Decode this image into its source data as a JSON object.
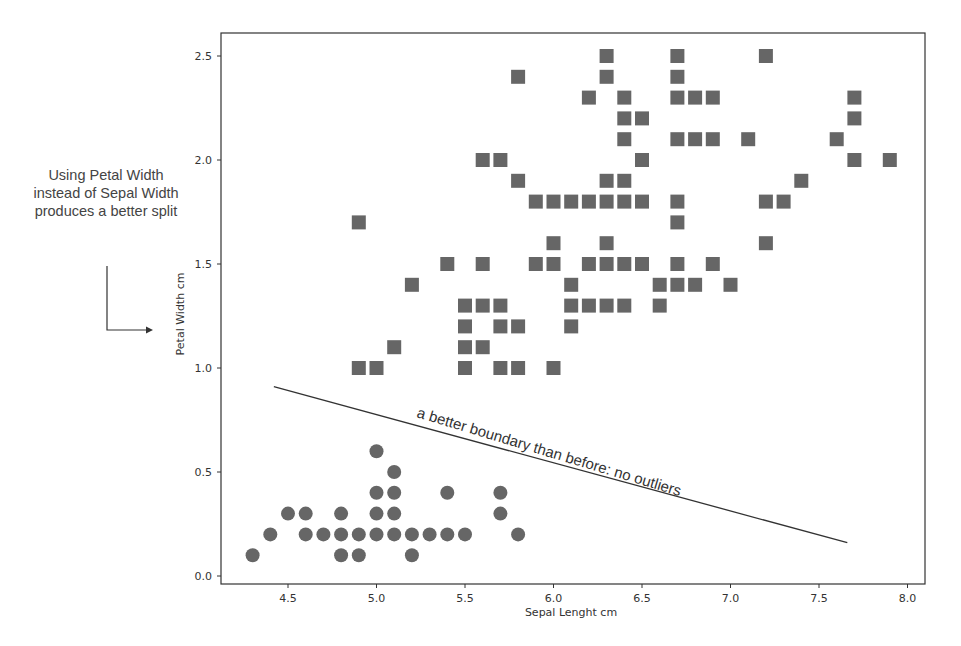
{
  "side_note": "Using Petal Width instead of Sepal Width produces a better split",
  "chart_data": {
    "type": "scatter",
    "title": "",
    "xlabel": "Sepal Lenght cm",
    "ylabel": "Petal Width cm",
    "xlim": [
      4.12,
      8.1
    ],
    "ylim": [
      -0.04,
      2.65
    ],
    "xticks": [
      4.5,
      5.0,
      5.5,
      6.0,
      6.5,
      7.0,
      7.5,
      8.0
    ],
    "xtick_labels": [
      "4.5",
      "5.0",
      "5.5",
      "6.0",
      "6.5",
      "7.0",
      "7.5",
      "8.0"
    ],
    "yticks": [
      0.0,
      0.5,
      1.0,
      1.5,
      2.0,
      2.5
    ],
    "ytick_labels": [
      "0.0",
      "0.5",
      "1.0",
      "1.5",
      "2.0",
      "2.5"
    ],
    "grid": false,
    "legend": null,
    "marker_color": "#666666",
    "series": [
      {
        "name": "circles",
        "marker": "circle",
        "points": [
          [
            4.3,
            0.1
          ],
          [
            4.8,
            0.1
          ],
          [
            4.9,
            0.1
          ],
          [
            5.2,
            0.1
          ],
          [
            4.4,
            0.2
          ],
          [
            4.6,
            0.2
          ],
          [
            4.7,
            0.2
          ],
          [
            4.8,
            0.2
          ],
          [
            4.9,
            0.2
          ],
          [
            5.0,
            0.2
          ],
          [
            5.1,
            0.2
          ],
          [
            5.2,
            0.2
          ],
          [
            5.3,
            0.2
          ],
          [
            5.4,
            0.2
          ],
          [
            5.5,
            0.2
          ],
          [
            5.8,
            0.2
          ],
          [
            4.5,
            0.3
          ],
          [
            4.6,
            0.3
          ],
          [
            4.8,
            0.3
          ],
          [
            5.0,
            0.3
          ],
          [
            5.1,
            0.3
          ],
          [
            5.7,
            0.3
          ],
          [
            5.0,
            0.4
          ],
          [
            5.1,
            0.4
          ],
          [
            5.4,
            0.4
          ],
          [
            5.7,
            0.4
          ],
          [
            5.1,
            0.5
          ],
          [
            5.0,
            0.6
          ]
        ]
      },
      {
        "name": "squares",
        "marker": "square",
        "points": [
          [
            4.9,
            1.0
          ],
          [
            5.0,
            1.0
          ],
          [
            5.5,
            1.0
          ],
          [
            5.7,
            1.0
          ],
          [
            5.8,
            1.0
          ],
          [
            6.0,
            1.0
          ],
          [
            5.1,
            1.1
          ],
          [
            5.5,
            1.1
          ],
          [
            5.6,
            1.1
          ],
          [
            5.5,
            1.2
          ],
          [
            5.7,
            1.2
          ],
          [
            5.8,
            1.2
          ],
          [
            6.1,
            1.2
          ],
          [
            5.5,
            1.3
          ],
          [
            5.6,
            1.3
          ],
          [
            5.7,
            1.3
          ],
          [
            6.1,
            1.3
          ],
          [
            6.2,
            1.3
          ],
          [
            6.3,
            1.3
          ],
          [
            6.4,
            1.3
          ],
          [
            6.6,
            1.3
          ],
          [
            5.2,
            1.4
          ],
          [
            6.1,
            1.4
          ],
          [
            6.6,
            1.4
          ],
          [
            6.7,
            1.4
          ],
          [
            6.8,
            1.4
          ],
          [
            7.0,
            1.4
          ],
          [
            5.4,
            1.5
          ],
          [
            5.6,
            1.5
          ],
          [
            5.9,
            1.5
          ],
          [
            6.0,
            1.5
          ],
          [
            6.2,
            1.5
          ],
          [
            6.3,
            1.5
          ],
          [
            6.4,
            1.5
          ],
          [
            6.5,
            1.5
          ],
          [
            6.7,
            1.5
          ],
          [
            6.9,
            1.5
          ],
          [
            6.0,
            1.6
          ],
          [
            6.3,
            1.6
          ],
          [
            7.2,
            1.6
          ],
          [
            4.9,
            1.7
          ],
          [
            6.7,
            1.7
          ],
          [
            5.9,
            1.8
          ],
          [
            6.0,
            1.8
          ],
          [
            6.1,
            1.8
          ],
          [
            6.2,
            1.8
          ],
          [
            6.3,
            1.8
          ],
          [
            6.4,
            1.8
          ],
          [
            6.5,
            1.8
          ],
          [
            6.7,
            1.8
          ],
          [
            7.2,
            1.8
          ],
          [
            7.3,
            1.8
          ],
          [
            5.8,
            1.9
          ],
          [
            6.3,
            1.9
          ],
          [
            6.4,
            1.9
          ],
          [
            7.4,
            1.9
          ],
          [
            5.6,
            2.0
          ],
          [
            5.7,
            2.0
          ],
          [
            6.5,
            2.0
          ],
          [
            7.7,
            2.0
          ],
          [
            7.9,
            2.0
          ],
          [
            6.4,
            2.1
          ],
          [
            6.7,
            2.1
          ],
          [
            6.8,
            2.1
          ],
          [
            6.9,
            2.1
          ],
          [
            7.1,
            2.1
          ],
          [
            7.6,
            2.1
          ],
          [
            6.4,
            2.2
          ],
          [
            6.5,
            2.2
          ],
          [
            7.7,
            2.2
          ],
          [
            6.2,
            2.3
          ],
          [
            6.4,
            2.3
          ],
          [
            6.7,
            2.3
          ],
          [
            6.8,
            2.3
          ],
          [
            6.9,
            2.3
          ],
          [
            7.7,
            2.3
          ],
          [
            5.8,
            2.4
          ],
          [
            6.3,
            2.4
          ],
          [
            6.7,
            2.4
          ],
          [
            6.3,
            2.5
          ],
          [
            6.7,
            2.5
          ],
          [
            7.2,
            2.5
          ]
        ]
      }
    ],
    "annotations": [
      {
        "type": "line",
        "label": "a better boundary than before: no outliers",
        "from": [
          4.42,
          0.91
        ],
        "to": [
          7.66,
          0.16
        ]
      }
    ]
  }
}
